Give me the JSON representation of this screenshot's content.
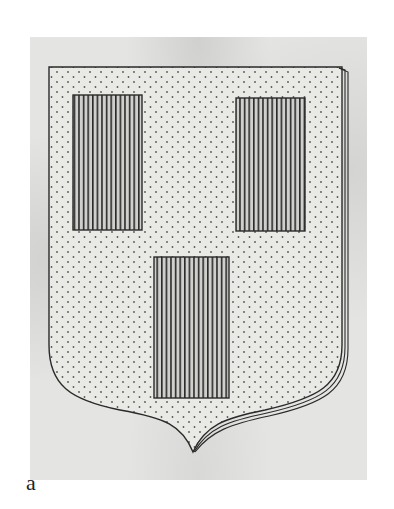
{
  "figure": {
    "label": "a",
    "colors": {
      "paper": "#e4e4e2",
      "field": "#e9e9e6",
      "ink": "#2a2a2a",
      "background": "#ffffff"
    },
    "charges": [
      {
        "name": "left-charge",
        "x": 73,
        "y": 95,
        "w": 69,
        "h": 135
      },
      {
        "name": "right-charge",
        "x": 236,
        "y": 98,
        "w": 69,
        "h": 133
      },
      {
        "name": "center-charge",
        "x": 154,
        "y": 257,
        "w": 75,
        "h": 141
      }
    ]
  }
}
